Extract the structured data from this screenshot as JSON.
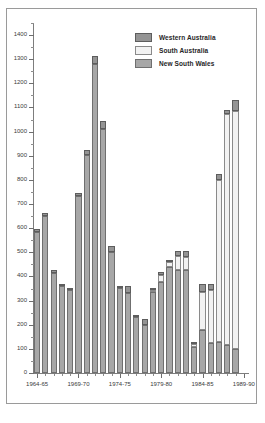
{
  "chart_data": {
    "type": "bar",
    "subtype": "stacked-vertical",
    "title": "",
    "xlabel": "",
    "ylabel": "",
    "ylim": [
      0,
      1450
    ],
    "ytick_step": 100,
    "yminor_step": 50,
    "grid": false,
    "legend_position": "top-right",
    "yticks": [
      0,
      100,
      200,
      300,
      400,
      500,
      600,
      700,
      800,
      900,
      1000,
      1100,
      1200,
      1300,
      1400
    ],
    "ytick_labels": [
      "0",
      "100",
      "200",
      "300",
      "400",
      "500",
      "600",
      "700",
      "800",
      "900",
      "1000",
      "1100",
      "1200",
      "1300",
      "1400"
    ],
    "categories": [
      "1964-65",
      "1965-66",
      "1966-67",
      "1967-68",
      "1968-69",
      "1969-70",
      "1970-71",
      "1971-72",
      "1972-73",
      "1973-74",
      "1974-75",
      "1975-76",
      "1976-77",
      "1977-78",
      "1978-79",
      "1979-80",
      "1980-81",
      "1981-82",
      "1982-83",
      "1983-84",
      "1984-85",
      "1985-86",
      "1986-87",
      "1987-88",
      "1988-89",
      "1989-90"
    ],
    "xtick_labels": [
      "1964-65",
      "1969-70",
      "1974-75",
      "1979-80",
      "1984-85",
      "1989-90"
    ],
    "xtick_indices": [
      0,
      5,
      10,
      15,
      20,
      25
    ],
    "series": [
      {
        "name": "New South Wales",
        "color": "#a7a7a7",
        "values": [
          585,
          650,
          415,
          362,
          345,
          735,
          905,
          1280,
          1012,
          500,
          352,
          330,
          230,
          200,
          335,
          378,
          440,
          425,
          425,
          112,
          180,
          125,
          128,
          115,
          100,
          0
        ]
      },
      {
        "name": "South Australia",
        "color": "#f2f2f2",
        "values": [
          0,
          0,
          0,
          0,
          0,
          0,
          0,
          0,
          0,
          0,
          0,
          0,
          0,
          0,
          8,
          30,
          18,
          60,
          55,
          12,
          155,
          218,
          670,
          960,
          985,
          0
        ]
      },
      {
        "name": "Western Australia",
        "color": "#949494",
        "values": [
          10,
          12,
          12,
          8,
          7,
          10,
          20,
          32,
          32,
          25,
          10,
          32,
          10,
          25,
          10,
          12,
          12,
          22,
          25,
          5,
          33,
          25,
          27,
          15,
          48,
          0
        ]
      }
    ],
    "totals": [
      595,
      662,
      427,
      370,
      352,
      745,
      925,
      1312,
      1044,
      525,
      362,
      392,
      240,
      225,
      353,
      420,
      470,
      507,
      505,
      129,
      368,
      368,
      825,
      1090,
      1133,
      0
    ]
  },
  "legend": {
    "items": [
      {
        "label": "Western Australia",
        "swatch": "legend-swatch-western-australia"
      },
      {
        "label": "South Australia",
        "swatch": "legend-swatch-south-australia"
      },
      {
        "label": "New South Wales",
        "swatch": "legend-swatch-new-south-wales"
      }
    ]
  }
}
